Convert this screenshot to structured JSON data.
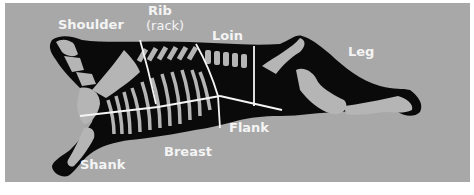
{
  "diagram": {
    "colors": {
      "background": "#a8a8a8",
      "carcass": "#0a0a0a",
      "bone": "#b5b5b5",
      "label": "#f4f4f4",
      "divider": "#f4f4f4",
      "page": "#ffffff"
    },
    "labels": {
      "shoulder": "Shoulder",
      "rib": "Rib",
      "rack": "(rack)",
      "loin": "Loin",
      "leg": "Leg",
      "flank": "Flank",
      "breast": "Breast",
      "shank": "Shank"
    }
  }
}
